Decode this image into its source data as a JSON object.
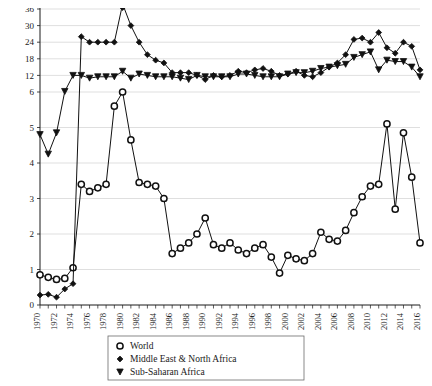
{
  "chart_data": {
    "type": "line",
    "title": "",
    "subtitle": "",
    "xlabel": "",
    "ylabel": "",
    "grid": true,
    "legend_position": "bottom-center",
    "axis_note": "Broken / dual y-axis: lower band 0-6 (linear, ticks 0,1,2,3,4,5), upper band 6-36 (compressed, ticks 6,12,18,24,30,36)",
    "x": [
      1970,
      1971,
      1972,
      1973,
      1974,
      1975,
      1976,
      1977,
      1978,
      1979,
      1980,
      1981,
      1982,
      1983,
      1984,
      1985,
      1986,
      1987,
      1988,
      1989,
      1990,
      1991,
      1992,
      1993,
      1994,
      1995,
      1996,
      1997,
      1998,
      1999,
      2000,
      2001,
      2002,
      2003,
      2004,
      2005,
      2006,
      2007,
      2008,
      2009,
      2010,
      2011,
      2012,
      2013,
      2014,
      2015,
      2016
    ],
    "xticks": [
      1970,
      1972,
      1974,
      1976,
      1978,
      1980,
      1982,
      1984,
      1986,
      1988,
      1990,
      1992,
      1994,
      1996,
      1998,
      2000,
      2002,
      2004,
      2006,
      2008,
      2010,
      2012,
      2014,
      2016
    ],
    "xlim": [
      1970,
      2016
    ],
    "yticks_lower": [
      0,
      1,
      2,
      3,
      4,
      5
    ],
    "yticks_upper": [
      6,
      12,
      18,
      24,
      30,
      36
    ],
    "ylim": [
      0,
      36
    ],
    "series": [
      {
        "name": "World",
        "marker": "open-circle",
        "values": [
          0.85,
          0.78,
          0.72,
          0.75,
          1.05,
          3.4,
          3.2,
          3.3,
          3.4,
          5.6,
          6.0,
          4.65,
          3.45,
          3.4,
          3.35,
          3.0,
          1.45,
          1.6,
          1.75,
          2.0,
          2.45,
          1.7,
          1.6,
          1.75,
          1.55,
          1.45,
          1.6,
          1.7,
          1.35,
          0.9,
          1.4,
          1.3,
          1.25,
          1.45,
          2.05,
          1.85,
          1.8,
          2.1,
          2.6,
          3.05,
          3.35,
          3.4,
          5.1,
          2.7,
          4.85,
          3.6,
          1.75
        ]
      },
      {
        "name": "Middle East & North Africa",
        "marker": "filled-diamond",
        "values": [
          0.28,
          0.3,
          0.22,
          0.45,
          0.6,
          26.0,
          24.0,
          24.0,
          24.0,
          24.0,
          36.5,
          30.0,
          24.0,
          19.5,
          17.5,
          16.5,
          13.0,
          13.0,
          13.0,
          12.0,
          10.5,
          12.0,
          11.5,
          12.0,
          13.5,
          13.0,
          14.0,
          14.5,
          13.5,
          12.0,
          12.5,
          13.5,
          12.0,
          11.5,
          13.0,
          15.0,
          16.5,
          19.5,
          25.0,
          25.5,
          24.0,
          27.5,
          22.0,
          20.0,
          24.0,
          22.5,
          14.0
        ]
      },
      {
        "name": "Sub-Saharan Africa",
        "marker": "filled-down-triangle",
        "values": [
          4.8,
          4.25,
          4.85,
          6.2,
          12.0,
          12.0,
          11.0,
          11.5,
          11.5,
          11.5,
          13.5,
          11.0,
          12.5,
          12.0,
          11.5,
          11.5,
          11.5,
          11.0,
          10.5,
          12.0,
          11.5,
          11.5,
          11.5,
          11.5,
          12.5,
          12.5,
          12.0,
          11.5,
          11.5,
          11.5,
          12.5,
          13.0,
          13.0,
          13.5,
          14.5,
          15.0,
          15.5,
          16.0,
          18.5,
          19.5,
          20.5,
          14.0,
          17.5,
          17.0,
          17.0,
          15.0,
          11.5
        ]
      }
    ]
  },
  "legend": {
    "entries": [
      {
        "label": "World",
        "marker": "open-circle"
      },
      {
        "label": "Middle East & North Africa",
        "marker": "filled-diamond"
      },
      {
        "label": "Sub-Saharan Africa",
        "marker": "filled-down-triangle"
      }
    ]
  }
}
